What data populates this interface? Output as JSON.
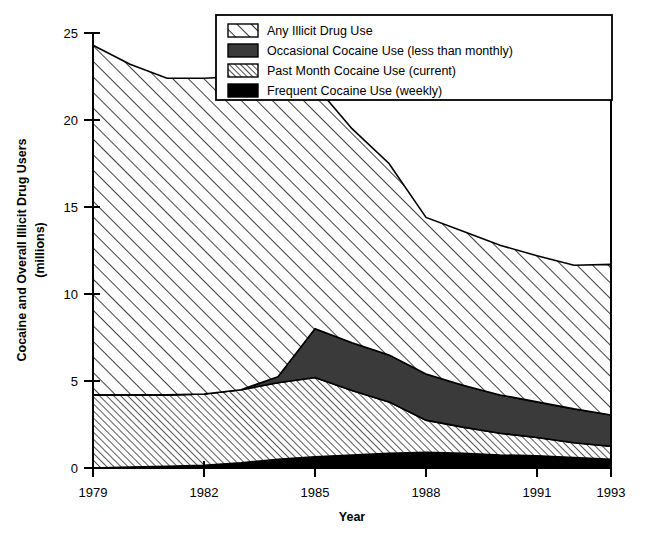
{
  "chart_data": {
    "type": "area",
    "stacked": true,
    "title": "",
    "xlabel": "Year",
    "ylabel": "Cocaine and Overall Illicit Drug Users (millions)",
    "ylabel_line1": "Cocaine and Overall Illicit Drug Users",
    "ylabel_line2": "(millions)",
    "xlim": [
      1979,
      1993
    ],
    "ylim": [
      0,
      25
    ],
    "yticks": [
      0,
      5,
      10,
      15,
      20,
      25
    ],
    "ytick_labels": [
      "0",
      "5",
      "10",
      "15",
      "20",
      "25"
    ],
    "xticks": [
      1979,
      1982,
      1985,
      1988,
      1991,
      1993
    ],
    "xtick_labels": [
      "1979",
      "1982",
      "1985",
      "1988",
      "1991",
      "1993"
    ],
    "grid": false,
    "legend_position": "top-right",
    "x": [
      1979,
      1980,
      1981,
      1982,
      1983,
      1984,
      1985,
      1986,
      1987,
      1988,
      1989,
      1990,
      1991,
      1992,
      1993
    ],
    "series": [
      {
        "name": "Frequent Cocaine Use (weekly)",
        "key": "frequent",
        "fill": "solid-black",
        "color": "#000000",
        "values": [
          0.0,
          0.05,
          0.1,
          0.15,
          0.3,
          0.5,
          0.65,
          0.75,
          0.85,
          0.9,
          0.85,
          0.75,
          0.7,
          0.6,
          0.5
        ]
      },
      {
        "name": "Past Month Cocaine Use (current)",
        "key": "past_month",
        "fill": "dense-diagonal-hatch",
        "color": "#ffffff",
        "values": [
          4.2,
          4.15,
          4.1,
          4.1,
          4.2,
          4.4,
          4.55,
          3.7,
          2.95,
          1.85,
          1.5,
          1.25,
          1.05,
          0.85,
          0.75
        ]
      },
      {
        "name": "Occasional Cocaine Use (less than monthly)",
        "key": "occasional",
        "fill": "solid-dark-gray",
        "color": "#3a3a3a",
        "values": [
          0.0,
          0.0,
          0.0,
          0.0,
          0.0,
          0.35,
          2.8,
          2.75,
          2.7,
          2.65,
          2.4,
          2.2,
          2.05,
          1.95,
          1.8
        ]
      },
      {
        "name": "Any Illicit Drug Use",
        "key": "any_illicit",
        "fill": "wide-diagonal-hatch",
        "color": "#ffffff",
        "values": [
          20.1,
          19.0,
          18.2,
          18.15,
          18.0,
          16.95,
          14.0,
          12.3,
          11.0,
          9.0,
          8.85,
          8.6,
          8.4,
          8.25,
          8.65
        ]
      }
    ],
    "totals": [
      24.3,
      23.2,
      22.4,
      22.4,
      22.5,
      22.2,
      22.0,
      19.5,
      17.5,
      14.4,
      13.6,
      12.8,
      12.2,
      11.65,
      11.7
    ],
    "legend": [
      {
        "label": "Any Illicit Drug Use",
        "fill": "wide-diagonal-hatch"
      },
      {
        "label": "Occasional Cocaine Use (less than monthly)",
        "fill": "solid-dark-gray"
      },
      {
        "label": "Past Month Cocaine Use (current)",
        "fill": "dense-diagonal-hatch"
      },
      {
        "label": "Frequent Cocaine Use (weekly)",
        "fill": "solid-black"
      }
    ],
    "colors": {
      "axis": "#000000",
      "background": "#ffffff",
      "occasional": "#3a3a3a",
      "frequent": "#000000",
      "hatch_stroke": "#000000"
    }
  }
}
